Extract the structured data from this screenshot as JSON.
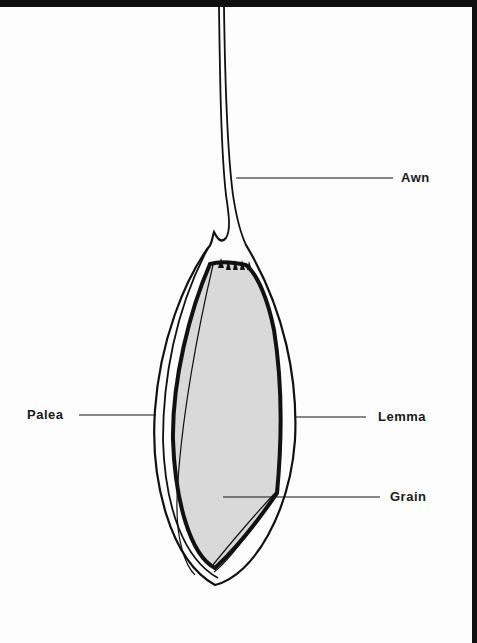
{
  "diagram": {
    "colors": {
      "outline": "#111111",
      "grain_fill": "#d9d9d9",
      "background": "#fdfdfd",
      "frame": "#111111"
    },
    "labels": {
      "awn": "Awn",
      "palea": "Palea",
      "lemma": "Lemma",
      "grain": "Grain"
    }
  }
}
